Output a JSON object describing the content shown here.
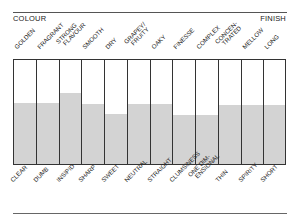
{
  "header": {
    "left_label": "COLOUR",
    "right_label": "FINISH"
  },
  "top_labels": [
    {
      "lines": [
        "GOLDEN"
      ]
    },
    {
      "lines": [
        "FRAGRANT"
      ]
    },
    {
      "lines": [
        "STRONG",
        "FLAVOUR"
      ]
    },
    {
      "lines": [
        "SMOOTH"
      ]
    },
    {
      "lines": [
        "DRY"
      ]
    },
    {
      "lines": [
        "GRAPEY/",
        "FRUITY"
      ]
    },
    {
      "lines": [
        "OAKY"
      ]
    },
    {
      "lines": [
        "FINESSE"
      ]
    },
    {
      "lines": [
        "COMPLEX"
      ]
    },
    {
      "lines": [
        "CONCEN-",
        "TRATED"
      ]
    },
    {
      "lines": [
        "MELLOW"
      ]
    },
    {
      "lines": [
        "LONG"
      ]
    }
  ],
  "bottom_labels": [
    {
      "lines": [
        "CLEAR"
      ]
    },
    {
      "lines": [
        "DUMB"
      ]
    },
    {
      "lines": [
        "INSIPID"
      ]
    },
    {
      "lines": [
        "SHARP"
      ]
    },
    {
      "lines": [
        "SWEET"
      ]
    },
    {
      "lines": [
        "NEUTRAL"
      ]
    },
    {
      "lines": [
        "STRAIGHT"
      ]
    },
    {
      "lines": [
        "CLUMSINESS"
      ]
    },
    {
      "lines": [
        "ONE DIM-",
        "ENSIONAL"
      ]
    },
    {
      "lines": [
        "THIN"
      ]
    },
    {
      "lines": [
        "SPIRITY"
      ]
    },
    {
      "lines": [
        "SHORT"
      ]
    }
  ],
  "colors": {
    "fill": "#d3d3d3",
    "border": "#333333"
  },
  "chart_data": {
    "type": "bar",
    "title": "",
    "xlabel": "",
    "ylabel": "",
    "ylim": [
      0,
      100
    ],
    "grid": false,
    "legend": "none",
    "top_axis_labels": [
      "GOLDEN",
      "FRAGRANT",
      "STRONG FLAVOUR",
      "SMOOTH",
      "DRY",
      "GRAPEY/FRUITY",
      "OAKY",
      "FINESSE",
      "COMPLEX",
      "CONCEN-TRATED",
      "MELLOW",
      "LONG"
    ],
    "categories": [
      "CLEAR",
      "DUMB",
      "INSIPID",
      "SHARP",
      "SWEET",
      "NEUTRAL",
      "STRAIGHT",
      "CLUMSINESS",
      "ONE DIM-ENSIONAL",
      "THIN",
      "SPIRITY",
      "SHORT"
    ],
    "values": [
      58,
      58,
      67,
      57,
      47,
      57,
      57,
      46,
      46,
      56,
      56,
      56
    ],
    "annotations": [
      "COLOUR (top-left)",
      "FINISH (top-right)"
    ]
  }
}
